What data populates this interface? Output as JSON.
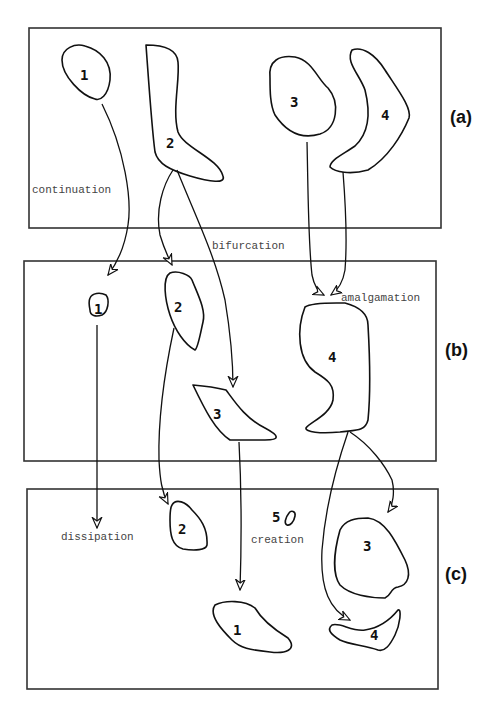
{
  "panels": [
    {
      "id": "a",
      "label": "(a)"
    },
    {
      "id": "b",
      "label": "(b)"
    },
    {
      "id": "c",
      "label": "(c)"
    }
  ],
  "events": {
    "continuation": "continuation",
    "bifurcation": "bifurcation",
    "amalgamation": "amalgamation",
    "dissipation": "dissipation",
    "creation": "creation"
  },
  "objects": {
    "a": [
      "1",
      "2",
      "3",
      "4"
    ],
    "b": [
      "1",
      "2",
      "3",
      "4"
    ],
    "c": [
      "1",
      "2",
      "3",
      "4",
      "5"
    ]
  }
}
